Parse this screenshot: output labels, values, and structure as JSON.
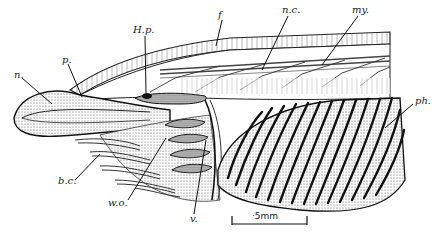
{
  "figure": {
    "labels": [
      {
        "id": "n",
        "text": "n.",
        "x": 14,
        "y": 70
      },
      {
        "id": "p",
        "text": "p.",
        "x": 62,
        "y": 56
      },
      {
        "id": "hp",
        "text": "H.p.",
        "x": 133,
        "y": 25
      },
      {
        "id": "f",
        "text": "f",
        "x": 218,
        "y": 12
      },
      {
        "id": "nc",
        "text": "n.c.",
        "x": 282,
        "y": 6
      },
      {
        "id": "my",
        "text": "my.",
        "x": 352,
        "y": 6
      },
      {
        "id": "ph",
        "text": "ph.",
        "x": 415,
        "y": 98
      },
      {
        "id": "bc",
        "text": "b.c.",
        "x": 58,
        "y": 177
      },
      {
        "id": "wo",
        "text": "w.o.",
        "x": 108,
        "y": 198
      },
      {
        "id": "v",
        "text": "v.",
        "x": 190,
        "y": 215
      }
    ],
    "scale_bar": {
      "label": "·5mm",
      "x1": 232,
      "x2": 307,
      "y": 224
    }
  }
}
